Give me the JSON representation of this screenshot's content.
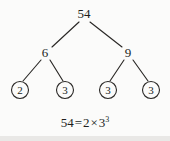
{
  "figure": {
    "type": "factor-tree",
    "caption": "Prime factor tree of 54",
    "background_color": "#fbfbfa",
    "ink_color": "#211f1d"
  },
  "tree": {
    "root": {
      "label": "54",
      "x": 84,
      "y": 14
    },
    "level2": [
      {
        "label": "6",
        "x": 45,
        "y": 53
      },
      {
        "label": "9",
        "x": 128,
        "y": 53
      }
    ],
    "leaves": [
      {
        "label": "2",
        "cx": 20,
        "cy": 90,
        "r": 8.5
      },
      {
        "label": "3",
        "cx": 65,
        "cy": 90,
        "r": 8.5
      },
      {
        "label": "3",
        "cx": 108,
        "cy": 90,
        "r": 8.5
      },
      {
        "label": "3",
        "cx": 151,
        "cy": 90,
        "r": 8.5
      }
    ],
    "edges": [
      {
        "from": "54",
        "to": "6",
        "x1": 79,
        "y1": 22,
        "x2": 52,
        "y2": 47
      },
      {
        "from": "54",
        "to": "9",
        "x1": 90,
        "y1": 22,
        "x2": 122,
        "y2": 47
      },
      {
        "from": "6",
        "to": "2",
        "x1": 41,
        "y1": 60,
        "x2": 23,
        "y2": 81
      },
      {
        "from": "6",
        "to": "3a",
        "x1": 50,
        "y1": 60,
        "x2": 63,
        "y2": 81
      },
      {
        "from": "9",
        "to": "3b",
        "x1": 124,
        "y1": 60,
        "x2": 110,
        "y2": 81
      },
      {
        "from": "9",
        "to": "3c",
        "x1": 133,
        "y1": 60,
        "x2": 148,
        "y2": 81
      }
    ]
  },
  "equation": {
    "left": "54",
    "equals": "=",
    "factor1": "2",
    "times": "×",
    "factor2_base": "3",
    "factor2_exponent": "3",
    "full_text": "54 = 2 × 3³"
  }
}
